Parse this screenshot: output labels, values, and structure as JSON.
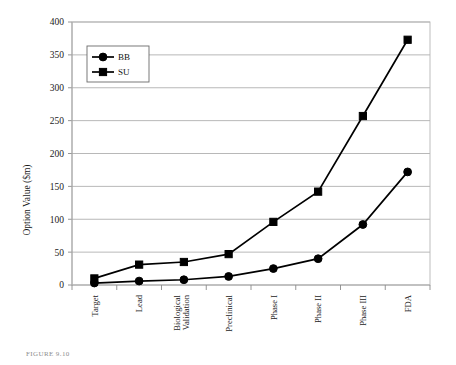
{
  "chart_data": {
    "type": "line",
    "title": "",
    "xlabel": "",
    "ylabel": "Option Value ($m)",
    "ylim": [
      0,
      400
    ],
    "ytick_step": 50,
    "yticks": [
      "0",
      "50",
      "100",
      "150",
      "200",
      "250",
      "300",
      "350",
      "400"
    ],
    "grid": "horizontal",
    "legend_position": "upper-left-inside",
    "categories": [
      "Target",
      "Lead",
      "Biological Validation",
      "Preclinical",
      "Phase I",
      "Phase II",
      "Phase III",
      "FDA"
    ],
    "category_lines": [
      [
        "Target"
      ],
      [
        "Lead"
      ],
      [
        "Biological",
        "Validation"
      ],
      [
        "Preclinical"
      ],
      [
        "Phase I"
      ],
      [
        "Phase II"
      ],
      [
        "Phase III"
      ],
      [
        "FDA"
      ]
    ],
    "series": [
      {
        "name": "BB",
        "marker": "circle",
        "color": "#000000",
        "values": [
          3,
          6,
          8,
          13,
          25,
          40,
          92,
          172
        ]
      },
      {
        "name": "SU",
        "marker": "square",
        "color": "#000000",
        "values": [
          10,
          31,
          35,
          47,
          96,
          142,
          257,
          373
        ]
      }
    ]
  },
  "legend": {
    "items": [
      {
        "label": "BB",
        "marker": "circle"
      },
      {
        "label": "SU",
        "marker": "square"
      }
    ]
  },
  "axes": {
    "y_title": "Option Value ($m)"
  },
  "caption": {
    "text": "FIGURE 9.10"
  }
}
